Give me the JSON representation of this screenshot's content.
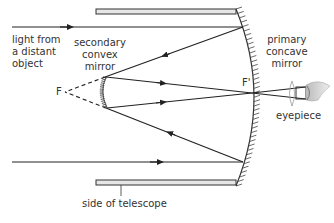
{
  "diagram": {
    "type": "Cassegrain reflecting telescope ray diagram",
    "labels": {
      "light_source": [
        "light from",
        "a distant",
        "object"
      ],
      "secondary_mirror": [
        "secondary",
        "convex",
        "mirror"
      ],
      "primary_mirror": [
        "primary",
        "concave",
        "mirror"
      ],
      "focal_point": "F",
      "focal_point_prime": "F'",
      "eyepiece": "eyepiece",
      "telescope_side": "side of telescope"
    },
    "colors": {
      "line": "#222222",
      "wall_fill": "#e6e6e6",
      "text": "#333333"
    }
  }
}
